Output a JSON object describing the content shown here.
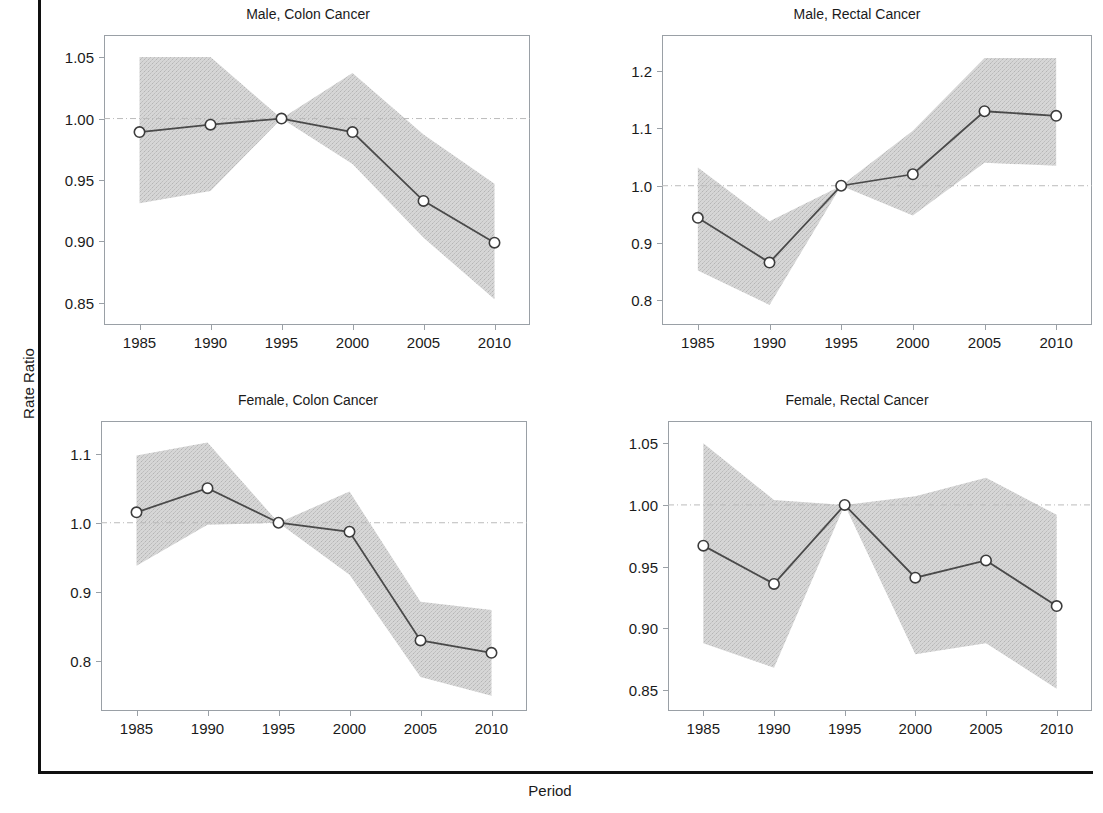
{
  "figure": {
    "xlabel": "Period",
    "ylabel": "Rate Ratio"
  },
  "chart_data": {
    "type": "line",
    "title": "",
    "xlabel": "Period",
    "ylabel": "Rate Ratio",
    "grid": false,
    "legend": "none",
    "reference_line": 1.0,
    "shared_x": [
      1985.5,
      1990.5,
      1995.5,
      2000.5,
      2005.5,
      2010.5
    ],
    "x_tick_labels": [
      "1985",
      "1990",
      "1995",
      "2000",
      "2005",
      "2010"
    ],
    "xlim": [
      1983.0,
      2013.0
    ],
    "panels": [
      {
        "id": "male-colon",
        "title": "Male, Colon Cancer",
        "ylabel": "Rate Ratio",
        "ylim": [
          0.832,
          1.068
        ],
        "y_tick_labels": [
          "0.85",
          "0.90",
          "0.95",
          "1.00",
          "1.05"
        ],
        "y_ticks": [
          0.85,
          0.9,
          0.95,
          1.0,
          1.05
        ],
        "values": [
          0.989,
          0.995,
          1.0,
          0.989,
          0.933,
          0.899
        ],
        "ci_lower": [
          0.931,
          0.941,
          1.0,
          0.963,
          0.903,
          0.853
        ],
        "ci_upper": [
          1.05,
          1.05,
          1.0,
          1.037,
          0.987,
          0.947
        ]
      },
      {
        "id": "male-rectal",
        "title": "Male, Rectal Cancer",
        "ylabel": "Rate Ratio",
        "ylim": [
          0.757,
          1.263
        ],
        "y_tick_labels": [
          "0.8",
          "0.9",
          "1.0",
          "1.1",
          "1.2"
        ],
        "y_ticks": [
          0.8,
          0.9,
          1.0,
          1.1,
          1.2
        ],
        "values": [
          0.944,
          0.866,
          1.0,
          1.02,
          1.13,
          1.122
        ],
        "ci_lower": [
          0.852,
          0.792,
          1.0,
          0.948,
          1.04,
          1.035
        ],
        "ci_upper": [
          1.032,
          0.938,
          1.0,
          1.096,
          1.223,
          1.223
        ]
      },
      {
        "id": "female-colon",
        "title": "Female, Colon Cancer",
        "ylabel": "Rate Ratio",
        "ylim": [
          0.728,
          1.147
        ],
        "y_tick_labels": [
          "0.8",
          "0.9",
          "1.0",
          "1.1"
        ],
        "y_ticks": [
          0.8,
          0.9,
          1.0,
          1.1
        ],
        "values": [
          1.015,
          1.05,
          1.0,
          0.987,
          0.83,
          0.812
        ],
        "ci_lower": [
          0.938,
          0.997,
          1.0,
          0.925,
          0.777,
          0.75
        ],
        "ci_upper": [
          1.097,
          1.116,
          1.0,
          1.045,
          0.886,
          0.874
        ]
      },
      {
        "id": "female-rectal",
        "title": "Female, Rectal Cancer",
        "ylabel": "Rate Ratio",
        "ylim": [
          0.833,
          1.068
        ],
        "y_tick_labels": [
          "0.85",
          "0.90",
          "0.95",
          "1.00",
          "1.05"
        ],
        "y_ticks": [
          0.85,
          0.9,
          0.95,
          1.0,
          1.05
        ],
        "values": [
          0.967,
          0.936,
          1.0,
          0.941,
          0.955,
          0.918
        ],
        "ci_lower": [
          0.888,
          0.868,
          1.0,
          0.879,
          0.888,
          0.851
        ],
        "ci_upper": [
          1.05,
          1.004,
          1.0,
          1.007,
          1.022,
          0.992
        ]
      }
    ],
    "style": {
      "band_color": "#c9c9c9",
      "line_color": "#4a4a4a",
      "marker_face": "#ffffff",
      "marker_edge": "#3c3c3c",
      "frame_color": "#9aa0a6",
      "reference_line_color": "#bbbbbb",
      "axis_color": "#101010"
    }
  }
}
